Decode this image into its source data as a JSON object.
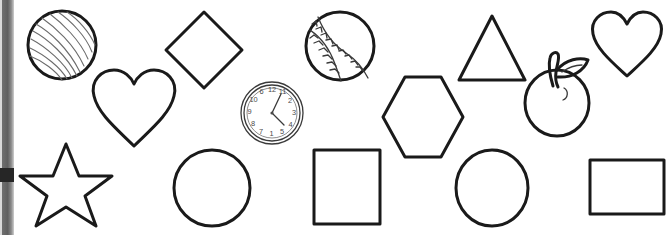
{
  "page": {
    "background_color": "#ffffff",
    "ink_color": "#1a1a1a",
    "width": 671,
    "height": 235
  },
  "gutter": {
    "name": "left-page-edge",
    "color": "#5f5f5f",
    "mark_color": "#262626"
  },
  "shapes": [
    {
      "id": "sphere",
      "label": "Striped Sphere",
      "kind": "ball",
      "row": 1,
      "column": 1
    },
    {
      "id": "heart-left",
      "label": "Heart",
      "kind": "heart",
      "row": 1,
      "column": 2
    },
    {
      "id": "diamond",
      "label": "Diamond",
      "kind": "diamond",
      "row": 1,
      "column": 3
    },
    {
      "id": "clock",
      "label": "Wall Clock",
      "kind": "clock",
      "row": 2,
      "column": 4
    },
    {
      "id": "baseball",
      "label": "Baseball",
      "kind": "baseball",
      "row": 1,
      "column": 5
    },
    {
      "id": "hexagon",
      "label": "Hexagon",
      "kind": "hexagon",
      "row": 2,
      "column": 6
    },
    {
      "id": "triangle",
      "label": "Triangle",
      "kind": "triangle",
      "row": 1,
      "column": 7
    },
    {
      "id": "apple",
      "label": "Apple with Leaf",
      "kind": "apple",
      "row": 2,
      "column": 8
    },
    {
      "id": "heart-right",
      "label": "Heart",
      "kind": "heart",
      "row": 1,
      "column": 9
    },
    {
      "id": "star",
      "label": "Five Pointed Star",
      "kind": "star",
      "row": 3,
      "column": 1
    },
    {
      "id": "circle-left",
      "label": "Circle",
      "kind": "circle",
      "row": 3,
      "column": 2
    },
    {
      "id": "square",
      "label": "Square",
      "kind": "square",
      "row": 3,
      "column": 4
    },
    {
      "id": "circle-right",
      "label": "Circle",
      "kind": "circle",
      "row": 3,
      "column": 6
    },
    {
      "id": "rectangle",
      "label": "Rectangle",
      "kind": "rectangle",
      "row": 3,
      "column": 8
    }
  ],
  "clock": {
    "label": "Wall Clock",
    "numerals": [
      "6",
      "12",
      "11",
      "10",
      "2",
      "9",
      "3",
      "8",
      "4",
      "7",
      "1",
      "5"
    ],
    "numeral_positions": [
      {
        "value": "6",
        "x": 23.5,
        "y": 12.5
      },
      {
        "value": "12",
        "x": 34.0,
        "y": 10.0
      },
      {
        "value": "11",
        "x": 44.5,
        "y": 12.5
      },
      {
        "value": "10",
        "x": 15.5,
        "y": 20.5
      },
      {
        "value": "2",
        "x": 52.0,
        "y": 21.0
      },
      {
        "value": "9",
        "x": 11.5,
        "y": 32.0
      },
      {
        "value": "3",
        "x": 56.0,
        "y": 33.0
      },
      {
        "value": "8",
        "x": 15.0,
        "y": 44.0
      },
      {
        "value": "4",
        "x": 52.5,
        "y": 45.0
      },
      {
        "value": "7",
        "x": 23.0,
        "y": 52.0
      },
      {
        "value": "1",
        "x": 33.5,
        "y": 54.5
      },
      {
        "value": "5",
        "x": 44.0,
        "y": 52.5
      }
    ],
    "hour_hand_angle_deg": 35,
    "minute_hand_angle_deg": 10
  }
}
